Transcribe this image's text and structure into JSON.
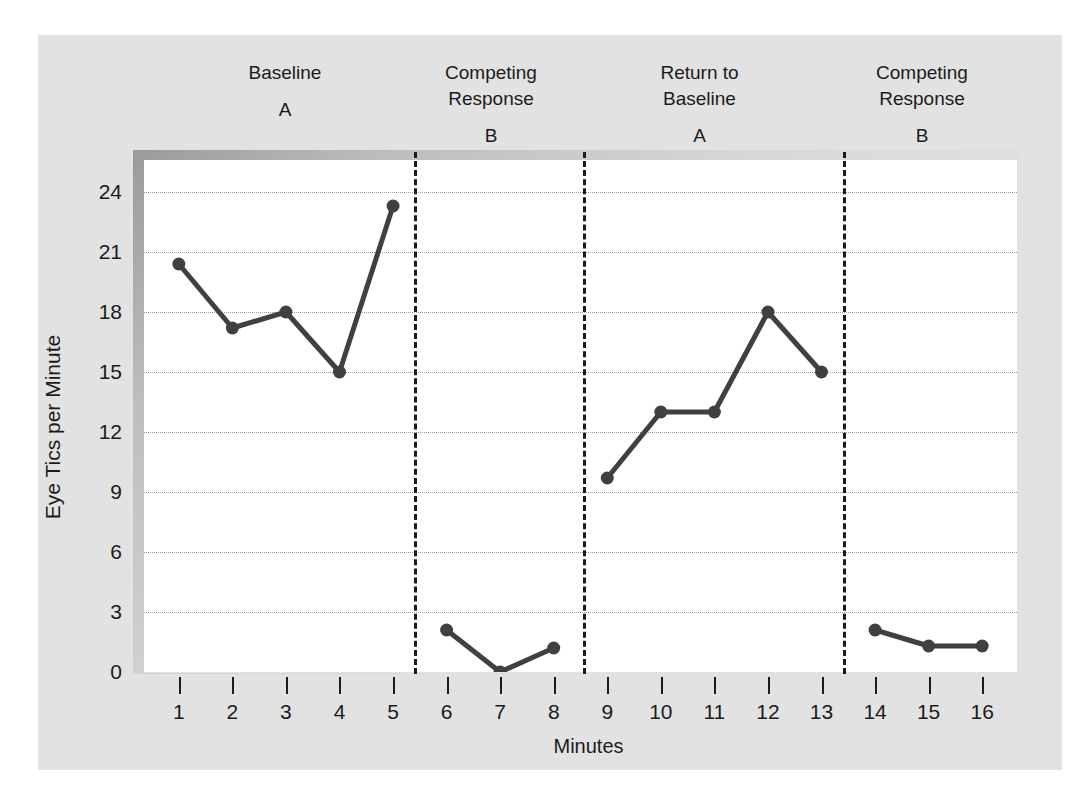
{
  "figure": {
    "panel_color": "#e2e2e2",
    "plot_bg": "#ffffff",
    "series_color": "#404040",
    "text_color": "#1b1b1b"
  },
  "phases": [
    {
      "name": "Baseline",
      "letter": "A",
      "start": 1,
      "end": 5
    },
    {
      "name": "Competing\nResponse",
      "letter": "B",
      "start": 6,
      "end": 8
    },
    {
      "name": "Return to\nBaseline",
      "letter": "A",
      "start": 9,
      "end": 13
    },
    {
      "name": "Competing\nResponse",
      "letter": "B",
      "start": 14,
      "end": 16
    }
  ],
  "chart_data": {
    "type": "line",
    "title": "",
    "xlabel": "Minutes",
    "ylabel": "Eye Tics per Minute",
    "xlim": [
      0.35,
      16.65
    ],
    "ylim": [
      0,
      25.6
    ],
    "xticks": [
      1,
      2,
      3,
      4,
      5,
      6,
      7,
      8,
      9,
      10,
      11,
      12,
      13,
      14,
      15,
      16
    ],
    "yticks": [
      0,
      3,
      6,
      9,
      12,
      15,
      18,
      21,
      24
    ],
    "grid": "horizontal-dotted",
    "legend": "none",
    "x": [
      1,
      2,
      3,
      4,
      5,
      6,
      7,
      8,
      9,
      10,
      11,
      12,
      13,
      14,
      15,
      16
    ],
    "series": [
      {
        "name": "Eye tics per minute",
        "color": "#404040",
        "segments": [
          {
            "phase": "Baseline A",
            "x": [
              1,
              2,
              3,
              4,
              5
            ],
            "values": [
              20.4,
              17.2,
              18.0,
              15.0,
              23.3
            ]
          },
          {
            "phase": "Competing Response B",
            "x": [
              6,
              7,
              8
            ],
            "values": [
              2.1,
              0.0,
              1.2
            ]
          },
          {
            "phase": "Return to Baseline A",
            "x": [
              9,
              10,
              11,
              12,
              13
            ],
            "values": [
              9.7,
              13.0,
              13.0,
              18.0,
              15.0
            ]
          },
          {
            "phase": "Competing Response B",
            "x": [
              14,
              15,
              16
            ],
            "values": [
              2.1,
              1.3,
              1.3
            ]
          }
        ]
      }
    ],
    "phase_dividers_x": [
      5.4,
      8.55,
      13.4
    ]
  }
}
